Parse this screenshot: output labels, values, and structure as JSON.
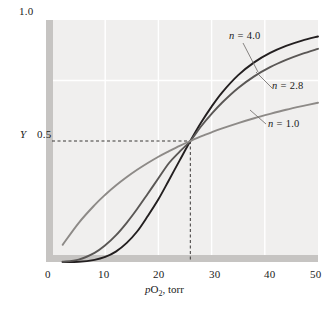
{
  "figure": {
    "name": "oxygen-binding-curves",
    "background": "#ffffff",
    "plot_background": "#f0efee",
    "axis_bar_color": "#c6c4c2",
    "gridline_color": "#ffffff"
  },
  "axes": {
    "y_top_label": "1.0",
    "y_mid_symbol": "Y",
    "y_mid_label": "0.5",
    "x_ticks": [
      "0",
      "10",
      "20",
      "30",
      "40",
      "50"
    ],
    "x_title_prefix": "p",
    "x_title_main": "O",
    "x_title_sub": "2",
    "x_title_suffix": ", torr"
  },
  "annotations": [
    {
      "id": "n4",
      "symbol": "n",
      "text": " = 4.0",
      "color": "#231f20"
    },
    {
      "id": "n28",
      "symbol": "n",
      "text": " = 2.8",
      "color": "#5a5755"
    },
    {
      "id": "n10",
      "symbol": "n",
      "text": " = 1.0",
      "color": "#8d8a87"
    }
  ],
  "chart_data": {
    "type": "line",
    "title": "",
    "xlabel": "pO2, torr",
    "ylabel": "Y",
    "xlim": [
      0,
      50
    ],
    "ylim": [
      0,
      1.0
    ],
    "grid": true,
    "legend_position": "inline-annotations",
    "p50": 26,
    "crossing_point": {
      "x": 26,
      "y": 0.5
    },
    "model": "Hill equation: Y = x^n / (p50^n + x^n)",
    "series": [
      {
        "name": "n = 4.0",
        "hill_coefficient": 4.0,
        "color": "#231f20",
        "x": [
          2,
          5,
          8,
          10,
          12,
          14,
          16,
          18,
          20,
          22,
          24,
          26,
          28,
          30,
          32,
          35,
          38,
          41,
          44,
          47,
          50
        ],
        "y": [
          0.0,
          0.001,
          0.009,
          0.021,
          0.043,
          0.078,
          0.126,
          0.19,
          0.259,
          0.339,
          0.42,
          0.5,
          0.575,
          0.642,
          0.701,
          0.772,
          0.825,
          0.864,
          0.893,
          0.915,
          0.932
        ]
      },
      {
        "name": "n = 2.8",
        "hill_coefficient": 2.8,
        "color": "#5a5755",
        "x": [
          2,
          5,
          8,
          10,
          12,
          14,
          16,
          18,
          20,
          22,
          24,
          26,
          28,
          30,
          32,
          35,
          38,
          41,
          44,
          47,
          50
        ],
        "y": [
          0.001,
          0.01,
          0.038,
          0.069,
          0.11,
          0.161,
          0.219,
          0.282,
          0.346,
          0.409,
          0.456,
          0.5,
          0.56,
          0.612,
          0.659,
          0.719,
          0.767,
          0.805,
          0.835,
          0.86,
          0.881
        ]
      },
      {
        "name": "n = 1.0",
        "hill_coefficient": 1.0,
        "color": "#8d8a87",
        "x": [
          2,
          5,
          8,
          10,
          12,
          14,
          16,
          18,
          20,
          22,
          24,
          26,
          28,
          30,
          32,
          35,
          38,
          41,
          44,
          47,
          50
        ],
        "y": [
          0.071,
          0.161,
          0.235,
          0.278,
          0.316,
          0.35,
          0.381,
          0.409,
          0.435,
          0.458,
          0.48,
          0.5,
          0.519,
          0.536,
          0.552,
          0.574,
          0.594,
          0.612,
          0.629,
          0.644,
          0.658
        ]
      }
    ],
    "guide_lines": [
      {
        "orientation": "horizontal",
        "value": 0.5,
        "style": "dashed",
        "from_x": 0,
        "to_x": 26
      },
      {
        "orientation": "vertical",
        "value": 26,
        "style": "dashed",
        "from_y": 0,
        "to_y": 0.5
      }
    ],
    "gridlines_x": [
      10,
      20,
      30,
      40
    ],
    "gridlines_y": [
      0.75
    ]
  }
}
